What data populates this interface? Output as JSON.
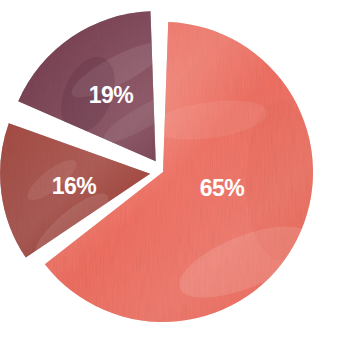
{
  "chart_data": {
    "type": "pie",
    "title": "",
    "subtitle": "",
    "xlabel": "",
    "ylabel": "",
    "grid": false,
    "legend_position": "none",
    "labels_inside_slices": true,
    "categories": [
      "65%",
      "16%",
      "19%"
    ],
    "values": [
      65,
      16,
      19
    ],
    "slices": [
      {
        "label": "65%",
        "value": 65,
        "color": "#ef6a5c",
        "start_angle_deg": 0,
        "sweep_deg": 234,
        "exploded": false,
        "label_x": 222,
        "label_y": 190
      },
      {
        "label": "16%",
        "value": 16,
        "color": "#9c3a33",
        "start_angle_deg": 234,
        "sweep_deg": 57.6,
        "exploded": true,
        "label_x": 74,
        "label_y": 188
      },
      {
        "label": "19%",
        "value": 19,
        "color": "#6e3547",
        "start_angle_deg": 291.6,
        "sweep_deg": 68.4,
        "exploded": true,
        "label_x": 111,
        "label_y": 97
      }
    ],
    "center_x": 163,
    "center_y": 172,
    "radius": 150,
    "background_color": "#ffffff",
    "label_color": "#ffffff",
    "separator_color": "#ffffff"
  }
}
